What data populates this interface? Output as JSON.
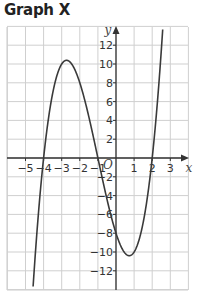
{
  "title": "Graph X",
  "chart_data": {
    "type": "line",
    "title": "Graph X",
    "xlabel": "x",
    "ylabel": "y",
    "origin_label": "O",
    "xlim": [
      -6,
      4
    ],
    "ylim": [
      -14,
      14
    ],
    "grid": true,
    "x_ticks": [
      -5,
      -4,
      -3,
      -2,
      -1,
      1,
      2,
      3
    ],
    "y_ticks": [
      -12,
      -10,
      -8,
      -6,
      -4,
      -2,
      2,
      4,
      6,
      8,
      10,
      12
    ],
    "x_tick_labels": [
      "−5",
      "−4",
      "−3",
      "−2",
      "−1",
      "1",
      "2",
      "3"
    ],
    "y_tick_labels": [
      "−12",
      "−10",
      "−8",
      "−6",
      "−4",
      "−2",
      "2",
      "4",
      "6",
      "8",
      "10",
      "12"
    ],
    "series": [
      {
        "name": "y = (x+4)(x+1)(x−2)",
        "x_intercepts": [
          -4,
          -1,
          2
        ],
        "y_intercept": -8,
        "local_max": [
          -2.7,
          10.4
        ],
        "local_min": [
          0.7,
          -10.4
        ],
        "x": [
          -4.25,
          -4,
          -3.5,
          -3,
          -2.7,
          -2.5,
          -2,
          -1.5,
          -1,
          -0.5,
          0,
          0.5,
          0.7,
          1,
          1.5,
          2,
          2.5,
          2.75
        ],
        "y": [
          -5.9,
          0,
          8.25,
          10,
          10.4,
          10.1,
          8,
          4.4,
          0,
          -4.4,
          -8,
          -10.1,
          -10.4,
          -10,
          -8.25,
          0,
          8.25,
          12.2
        ]
      }
    ]
  }
}
